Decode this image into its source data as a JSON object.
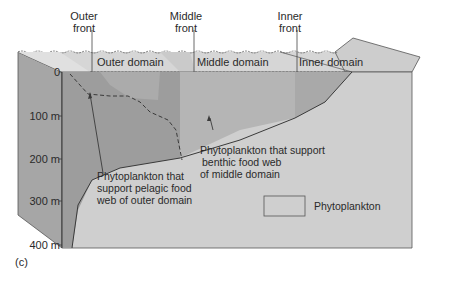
{
  "fronts": [
    {
      "label_line1": "Outer",
      "label_line2": "front"
    },
    {
      "label_line1": "Middle",
      "label_line2": "front"
    },
    {
      "label_line1": "Inner",
      "label_line2": "front"
    }
  ],
  "domains": [
    {
      "label": "Outer domain"
    },
    {
      "label": "Middle domain"
    },
    {
      "label": "Inner domain"
    }
  ],
  "depth_axis": {
    "ticks": [
      "0",
      "100 m",
      "200 m",
      "300 m",
      "400 m"
    ]
  },
  "annotations": {
    "pelagic": [
      "Phytoplankton that",
      "support pelagic food",
      "web of outer domain"
    ],
    "benthic": [
      "Phytoplankton that support",
      "benthic food web",
      "of middle domain"
    ]
  },
  "legend": {
    "label": "Phytoplankton"
  },
  "panel_label": "(c)",
  "colors": {
    "water_dark": "#9a9a9a",
    "water_mid": "#b3b3b3",
    "water_light": "#c6c6c6",
    "seafloor": "#cfcfcf",
    "surface": "#d4d4d4",
    "side": "#a8a8a8",
    "line": "#3a3a3a"
  }
}
